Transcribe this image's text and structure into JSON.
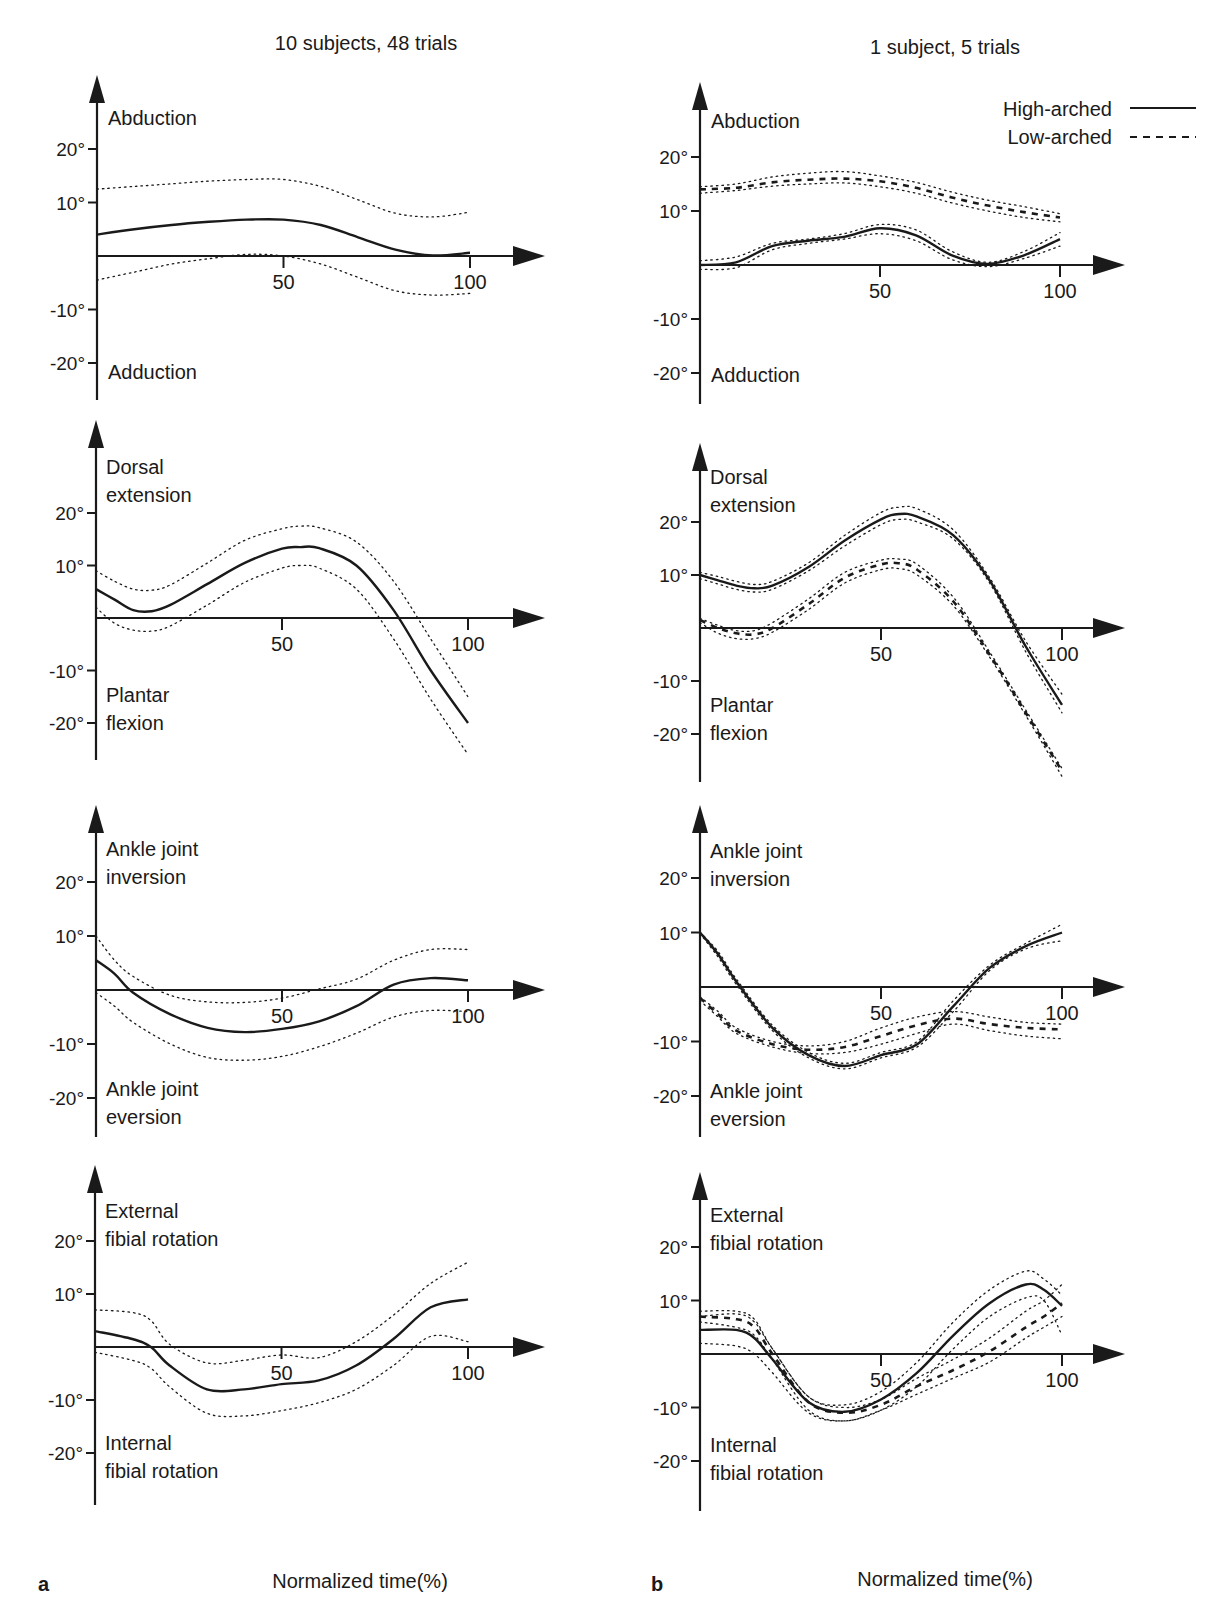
{
  "figure": {
    "col_titles": [
      "10 subjects, 48 trials",
      "1 subject, 5 trials"
    ],
    "panel_letters": [
      "a",
      "b"
    ],
    "xlabel": "Normalized time(%)",
    "legend": [
      {
        "label": "High-arched",
        "style": "solid"
      },
      {
        "label": "Low-arched",
        "style": "dashed"
      }
    ],
    "ytick_labels": [
      "20°",
      "10°",
      "-10°",
      "-20°"
    ],
    "xtick_labels": [
      "50",
      "100"
    ],
    "colors": {
      "ink": "#1a1a1a",
      "background": "#ffffff"
    }
  },
  "chart_data": [
    {
      "type": "line",
      "panel": "a",
      "row": 1,
      "title": "10 subjects, 48 trials",
      "ylabel_top": "Abduction",
      "ylabel_bottom": "Adduction",
      "xlabel": "Normalized time(%)",
      "xlim": [
        0,
        100
      ],
      "ylim": [
        -25,
        30
      ],
      "x": [
        0,
        10,
        20,
        30,
        40,
        50,
        60,
        70,
        80,
        90,
        100
      ],
      "series": [
        {
          "name": "Mean",
          "style": "solid",
          "values": [
            4,
            5,
            5.8,
            6.4,
            6.8,
            6.8,
            5.8,
            3.5,
            1.2,
            0.1,
            0.6
          ]
        },
        {
          "name": "+1 SD",
          "style": "dotted",
          "values": [
            12.5,
            13,
            13.5,
            14,
            14.3,
            14.3,
            13,
            10.5,
            8,
            7.3,
            8.2
          ]
        },
        {
          "name": "-1 SD",
          "style": "dotted",
          "values": [
            -4.5,
            -3,
            -1.5,
            -0.5,
            0.3,
            0,
            -1.5,
            -4,
            -6.5,
            -7.3,
            -7
          ]
        }
      ]
    },
    {
      "type": "line",
      "panel": "b",
      "row": 1,
      "title": "1 subject, 5 trials",
      "ylabel_top": "Abduction",
      "ylabel_bottom": "Adduction",
      "xlabel": "Normalized time(%)",
      "xlim": [
        0,
        100
      ],
      "ylim": [
        -25,
        30
      ],
      "x": [
        0,
        10,
        20,
        30,
        40,
        50,
        60,
        70,
        80,
        90,
        100
      ],
      "series": [
        {
          "name": "High-arched",
          "style": "solid",
          "values": [
            0,
            0.5,
            3.5,
            4.5,
            5.2,
            6.8,
            5.5,
            1.8,
            0.2,
            1.8,
            4.8
          ]
        },
        {
          "name": "High-arched +SD",
          "style": "dotted",
          "values": [
            0.8,
            1.5,
            4,
            4.8,
            5.8,
            7.5,
            6.5,
            2.5,
            0.5,
            2.5,
            6
          ]
        },
        {
          "name": "High-arched -SD",
          "style": "dotted",
          "values": [
            -0.8,
            -0.5,
            2.8,
            4,
            4.8,
            5.8,
            4.5,
            1,
            -0.3,
            1.2,
            3.5
          ]
        },
        {
          "name": "Low-arched",
          "style": "dashed",
          "values": [
            14,
            14.3,
            15.3,
            15.8,
            16,
            15.5,
            14.3,
            12.5,
            11,
            9.8,
            8.8
          ]
        },
        {
          "name": "Low-arched +SD",
          "style": "dotted",
          "values": [
            14.5,
            15,
            16.3,
            17,
            17.3,
            16.5,
            15.3,
            13.5,
            12,
            10.8,
            9.5
          ]
        },
        {
          "name": "Low-arched -SD",
          "style": "dotted",
          "values": [
            13.3,
            13.8,
            14.6,
            15,
            15.2,
            14.5,
            13.3,
            11.5,
            10,
            8.8,
            8
          ]
        }
      ]
    },
    {
      "type": "line",
      "panel": "a",
      "row": 2,
      "ylabel_top": "Dorsal extension",
      "ylabel_bottom": "Plantar flexion",
      "xlabel": "Normalized time(%)",
      "xlim": [
        0,
        100
      ],
      "ylim": [
        -27,
        30
      ],
      "x": [
        0,
        5,
        10,
        15,
        20,
        30,
        40,
        50,
        55,
        60,
        70,
        80,
        90,
        100
      ],
      "series": [
        {
          "name": "Mean",
          "style": "solid",
          "values": [
            5.5,
            3.5,
            1.5,
            1.3,
            2.5,
            6.5,
            10.5,
            13.2,
            13.5,
            13.3,
            10,
            1.5,
            -10,
            -20
          ]
        },
        {
          "name": "+1 SD",
          "style": "dotted",
          "values": [
            9,
            7,
            5.5,
            5.3,
            6.3,
            10.5,
            14.8,
            17,
            17.5,
            17.2,
            14.5,
            7,
            -4,
            -15
          ]
        },
        {
          "name": "-1 SD",
          "style": "dotted",
          "values": [
            2,
            -1,
            -2.3,
            -2.5,
            -1.5,
            2.5,
            6.8,
            9.5,
            10,
            9.5,
            5.5,
            -4,
            -15.5,
            -26
          ]
        }
      ]
    },
    {
      "type": "line",
      "panel": "b",
      "row": 2,
      "ylabel_top": "Dorsal extension",
      "ylabel_bottom": "Plantar flexion",
      "xlabel": "Normalized time(%)",
      "xlim": [
        0,
        100
      ],
      "ylim": [
        -28,
        30
      ],
      "x": [
        0,
        5,
        10,
        15,
        20,
        30,
        40,
        50,
        55,
        60,
        70,
        80,
        90,
        100
      ],
      "series": [
        {
          "name": "High-arched",
          "style": "solid",
          "values": [
            10,
            9,
            8,
            7.5,
            8,
            11.5,
            16.5,
            20.5,
            21.5,
            21,
            17.5,
            9,
            -3.5,
            -14.5
          ]
        },
        {
          "name": "High-arched +SD",
          "style": "dotted",
          "values": [
            10.5,
            9.7,
            8.8,
            8.2,
            8.8,
            12.3,
            17.5,
            21.8,
            22.8,
            22.5,
            18.5,
            9.5,
            -2.5,
            -12.5
          ]
        },
        {
          "name": "High-arched -SD",
          "style": "dotted",
          "values": [
            9.3,
            8.3,
            7.3,
            6.8,
            7.3,
            10.8,
            15.5,
            19.5,
            20.5,
            20,
            16.8,
            8.5,
            -4.5,
            -16
          ]
        },
        {
          "name": "Low-arched",
          "style": "dashed",
          "values": [
            1.5,
            0,
            -1,
            -1.2,
            0,
            4.5,
            9.5,
            12,
            12.2,
            11,
            5,
            -5,
            -16,
            -27
          ]
        },
        {
          "name": "Low-arched +SD",
          "style": "dotted",
          "values": [
            1.8,
            0.5,
            -0.5,
            -0.5,
            1,
            5.5,
            10.5,
            12.8,
            13,
            12,
            5.8,
            -4.5,
            -15.5,
            -26.5
          ]
        },
        {
          "name": "Low-arched -SD",
          "style": "dotted",
          "values": [
            1,
            -1,
            -2,
            -2,
            -0.8,
            3.5,
            8.5,
            11,
            11.2,
            10,
            4.2,
            -5.5,
            -16.5,
            -28
          ]
        }
      ]
    },
    {
      "type": "line",
      "panel": "a",
      "row": 3,
      "ylabel_top": "Ankle joint inversion",
      "ylabel_bottom": "Ankle joint eversion",
      "xlabel": "Normalized time(%)",
      "xlim": [
        0,
        100
      ],
      "ylim": [
        -25,
        30
      ],
      "x": [
        0,
        5,
        10,
        20,
        30,
        40,
        50,
        60,
        70,
        80,
        90,
        100
      ],
      "series": [
        {
          "name": "Mean",
          "style": "solid",
          "values": [
            5.5,
            3,
            -0.5,
            -4.5,
            -7,
            -7.8,
            -7.2,
            -5.8,
            -3,
            1,
            2.2,
            1.8
          ]
        },
        {
          "name": "+1 SD",
          "style": "dotted",
          "values": [
            10,
            5.5,
            2.5,
            -1,
            -2.2,
            -2.3,
            -1.5,
            0.2,
            2,
            5.5,
            7.5,
            7.5
          ]
        },
        {
          "name": "-1 SD",
          "style": "dotted",
          "values": [
            -0.5,
            -3,
            -6,
            -10,
            -12.5,
            -13,
            -12.3,
            -10.5,
            -8,
            -5,
            -3.8,
            -4
          ]
        }
      ]
    },
    {
      "type": "line",
      "panel": "b",
      "row": 3,
      "ylabel_top": "Ankle joint inversion",
      "ylabel_bottom": "Ankle joint eversion",
      "xlabel": "Normalized time(%)",
      "xlim": [
        0,
        100
      ],
      "ylim": [
        -25,
        30
      ],
      "x": [
        0,
        5,
        10,
        20,
        30,
        40,
        50,
        60,
        70,
        80,
        90,
        100
      ],
      "series": [
        {
          "name": "High-arched",
          "style": "solid",
          "values": [
            10,
            6,
            1,
            -7.5,
            -12.5,
            -14.5,
            -12.5,
            -10.5,
            -3.5,
            3.5,
            7.5,
            10
          ]
        },
        {
          "name": "High-arched +SD",
          "style": "dotted",
          "values": [
            10,
            6.5,
            1.5,
            -7,
            -12,
            -14,
            -12,
            -10,
            -2.5,
            4,
            8,
            11.5
          ]
        },
        {
          "name": "High-arched -SD",
          "style": "dotted",
          "values": [
            9.8,
            5.5,
            0.5,
            -8,
            -13,
            -15,
            -13,
            -11,
            -4.5,
            3,
            7,
            8.5
          ]
        },
        {
          "name": "Low-arched",
          "style": "dashed",
          "values": [
            -2,
            -5,
            -8,
            -10.5,
            -11.5,
            -11,
            -9,
            -7,
            -5.8,
            -6.8,
            -7.5,
            -7.8
          ]
        },
        {
          "name": "Low-arched +SD",
          "style": "dotted",
          "values": [
            -1.8,
            -4.5,
            -7.5,
            -10,
            -10.8,
            -10,
            -7.5,
            -5.5,
            -4.5,
            -5.5,
            -6.5,
            -6.8
          ]
        },
        {
          "name": "Low-arched -SD",
          "style": "dotted",
          "values": [
            -2.5,
            -5.5,
            -8.5,
            -11,
            -12.2,
            -12,
            -10.5,
            -8.5,
            -6.8,
            -8,
            -9,
            -9.5
          ]
        }
      ]
    },
    {
      "type": "line",
      "panel": "a",
      "row": 4,
      "ylabel_top": "External fibial rotation",
      "ylabel_bottom": "Internal fibial rotation",
      "xlabel": "Normalized time(%)",
      "xlim": [
        0,
        100
      ],
      "ylim": [
        -25,
        30
      ],
      "x": [
        0,
        10,
        15,
        20,
        30,
        40,
        50,
        60,
        70,
        80,
        90,
        100
      ],
      "series": [
        {
          "name": "Mean",
          "style": "solid",
          "values": [
            3,
            1.5,
            0,
            -3.5,
            -8,
            -8,
            -7,
            -6.3,
            -3.5,
            1.5,
            7.5,
            9
          ]
        },
        {
          "name": "+1 SD",
          "style": "dotted",
          "values": [
            7,
            6.5,
            5,
            0.5,
            -3,
            -2.5,
            -1.5,
            -2,
            1,
            6,
            12,
            16
          ]
        },
        {
          "name": "-1 SD",
          "style": "dotted",
          "values": [
            -1,
            -2.5,
            -4,
            -7.5,
            -12.5,
            -13,
            -12,
            -10.5,
            -8,
            -3.5,
            2,
            1
          ]
        }
      ]
    },
    {
      "type": "line",
      "panel": "b",
      "row": 4,
      "ylabel_top": "External fibial rotation",
      "ylabel_bottom": "Internal fibial rotation",
      "xlabel": "Normalized time(%)",
      "xlim": [
        0,
        100
      ],
      "ylim": [
        -25,
        30
      ],
      "x": [
        0,
        10,
        15,
        20,
        30,
        40,
        50,
        60,
        70,
        80,
        90,
        95,
        100
      ],
      "series": [
        {
          "name": "High-arched",
          "style": "solid",
          "values": [
            4.5,
            4.5,
            3,
            -1,
            -9,
            -10.8,
            -8.5,
            -3.5,
            3.5,
            9.5,
            13,
            12,
            9
          ]
        },
        {
          "name": "High-arched +SD",
          "style": "dotted",
          "values": [
            7,
            7.5,
            6,
            1,
            -8,
            -9.5,
            -7,
            -1.5,
            6,
            12,
            15.5,
            14,
            11
          ]
        },
        {
          "name": "High-arched -SD",
          "style": "dotted",
          "values": [
            2,
            1.5,
            0,
            -3.5,
            -11,
            -12.5,
            -10.5,
            -6,
            1,
            7,
            10.5,
            10,
            3.5
          ]
        },
        {
          "name": "Low-arched",
          "style": "dashed",
          "values": [
            7,
            6.5,
            5,
            0,
            -9,
            -11,
            -9.5,
            -6,
            -3,
            0.5,
            5,
            7,
            9.5
          ]
        },
        {
          "name": "Low-arched +SD",
          "style": "dotted",
          "values": [
            8,
            8,
            6.5,
            1,
            -8,
            -10,
            -8.5,
            -4.5,
            -1,
            3,
            8,
            10,
            13
          ]
        },
        {
          "name": "Low-arched -SD",
          "style": "dotted",
          "values": [
            6,
            5,
            3.5,
            -1,
            -10.5,
            -12.5,
            -10.5,
            -7.5,
            -4.5,
            -1.5,
            3,
            5,
            7
          ]
        }
      ]
    }
  ]
}
